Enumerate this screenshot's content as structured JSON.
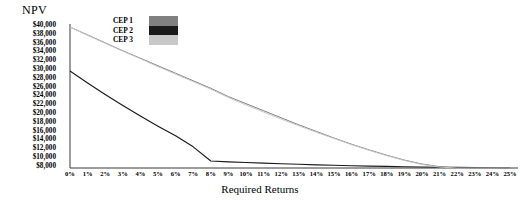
{
  "chart_data": {
    "type": "line",
    "title": "",
    "ylabel": "NPV",
    "xlabel": "Required Returns",
    "grid": false,
    "legend_position": "top-left-inside",
    "ylim": [
      8000,
      40000
    ],
    "xlim": [
      0,
      25
    ],
    "y_tick_labels": [
      "$40,000",
      "$38,000",
      "$36,000",
      "$34,000",
      "$32,000",
      "$30,000",
      "$28,000",
      "$26,000",
      "$24,000",
      "$22,000",
      "$20,000",
      "$18,000",
      "$16,000",
      "$14,000",
      "$12,000",
      "$10,000",
      "$8,000"
    ],
    "y_tick_values": [
      40000,
      38000,
      36000,
      34000,
      32000,
      30000,
      28000,
      26000,
      24000,
      22000,
      20000,
      18000,
      16000,
      14000,
      12000,
      10000,
      8000
    ],
    "x_tick_labels": [
      "0%",
      "1%",
      "2%",
      "3%",
      "4%",
      "5%",
      "6%",
      "7%",
      "8%",
      "9%",
      "10%",
      "11%",
      "12%",
      "13%",
      "14%",
      "15%",
      "16%",
      "17%",
      "18%",
      "19%",
      "20%",
      "21%",
      "22%",
      "23%",
      "24%",
      "25%"
    ],
    "x": [
      0,
      1,
      2,
      3,
      4,
      5,
      6,
      7,
      8,
      9,
      10,
      11,
      12,
      13,
      14,
      15,
      16,
      17,
      18,
      19,
      20,
      21,
      22,
      23,
      24,
      25
    ],
    "series": [
      {
        "name": "CEP 1",
        "color": "#808080",
        "values": [
          40000,
          38200,
          36400,
          34600,
          32900,
          31200,
          29500,
          27800,
          26100,
          24200,
          22600,
          21000,
          19400,
          17800,
          16300,
          14800,
          13400,
          12100,
          10900,
          9800,
          8900,
          8300,
          8000,
          7900,
          7900,
          7900
        ]
      },
      {
        "name": "CEP 2",
        "color": "#1a1a1a",
        "values": [
          30000,
          27300,
          24700,
          22200,
          19800,
          17500,
          15300,
          12800,
          9600,
          9400,
          9250,
          9100,
          8960,
          8840,
          8720,
          8620,
          8520,
          8440,
          8360,
          8290,
          8230,
          8180,
          8140,
          8100,
          8060,
          8020
        ]
      },
      {
        "name": "CEP 3",
        "color": "#c8c8c8",
        "values": [
          40000,
          38100,
          36300,
          34500,
          32800,
          31000,
          29300,
          27600,
          25900,
          24000,
          22300,
          20700,
          19100,
          17600,
          16100,
          14700,
          13300,
          12000,
          10800,
          9700,
          8800,
          8200,
          7950,
          7880,
          7880,
          7880
        ]
      }
    ]
  },
  "legend": {
    "items": [
      {
        "label": "CEP 1",
        "color": "#808080"
      },
      {
        "label": "CEP 2",
        "color": "#1a1a1a"
      },
      {
        "label": "CEP 3",
        "color": "#c8c8c8"
      }
    ]
  },
  "axis": {
    "axis_color": "#3a3a3a"
  }
}
